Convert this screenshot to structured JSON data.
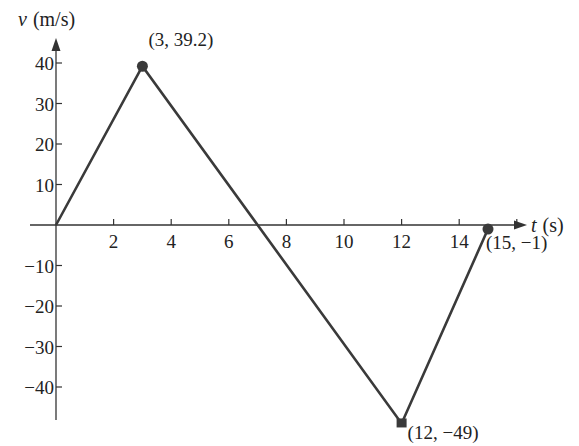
{
  "chart_data": {
    "type": "line",
    "title": "",
    "xlabel": "t (s)",
    "ylabel": "v (m/s)",
    "xlabel_var": "t",
    "xlabel_unit": "(s)",
    "ylabel_var": "v",
    "ylabel_unit": "(m/s)",
    "x_ticks": [
      2,
      4,
      6,
      8,
      10,
      12,
      14
    ],
    "y_ticks": [
      40,
      30,
      20,
      10,
      -10,
      -20,
      -30,
      -40
    ],
    "xlim": [
      0,
      16
    ],
    "ylim": [
      -50,
      42
    ],
    "grid": false,
    "series": [
      {
        "name": "velocity",
        "points": [
          [
            0,
            0
          ],
          [
            3,
            39.2
          ],
          [
            12,
            -49
          ],
          [
            15,
            -1
          ]
        ]
      }
    ],
    "annotations": [
      {
        "x": 3,
        "y": 39.2,
        "label": "(3, 39.2)"
      },
      {
        "x": 12,
        "y": -49,
        "label": "(12, −49)"
      },
      {
        "x": 15,
        "y": -1,
        "label": "(15, −1)"
      }
    ],
    "colors": {
      "line": "#3a3a3a",
      "axis": "#333333",
      "marker": "#3a3a3a"
    }
  }
}
